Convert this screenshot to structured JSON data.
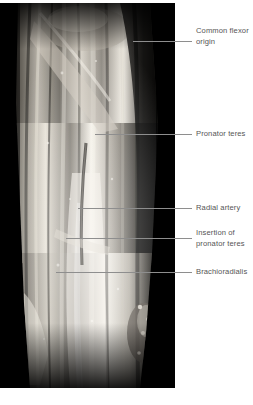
{
  "figure": {
    "kind": "anatomical-dissection-photograph",
    "region": "forearm",
    "view": "anterior",
    "photo": {
      "x": 0,
      "y": 3,
      "width": 175,
      "height": 385,
      "palette": {
        "background": "#000000",
        "tissue_light": "#f2efe9",
        "tissue_mid": "#9a958c",
        "tissue_dark": "#2a2824",
        "shadow": "#0a0a0a"
      }
    },
    "annotations": [
      {
        "id": "common-flexor-origin",
        "lines": [
          "Common flexor",
          "origin"
        ],
        "line_1": "Common flexor",
        "line_2": "origin",
        "label_x": 196,
        "label_y": 26,
        "leader": {
          "x1": 133,
          "y1": 41,
          "x2": 192,
          "y2": 41
        }
      },
      {
        "id": "pronator-teres",
        "lines": [
          "Pronator teres"
        ],
        "line_1": "Pronator teres",
        "label_x": 196,
        "label_y": 129,
        "leader": {
          "x1": 95,
          "y1": 134,
          "x2": 192,
          "y2": 134
        }
      },
      {
        "id": "radial-artery",
        "lines": [
          "Radial artery"
        ],
        "line_1": "Radial artery",
        "label_x": 196,
        "label_y": 203,
        "leader": {
          "x1": 78,
          "y1": 208,
          "x2": 192,
          "y2": 208
        }
      },
      {
        "id": "insertion-of-pronator-teres",
        "lines": [
          "Insertion of",
          "pronator teres"
        ],
        "line_1": "Insertion of",
        "line_2": "pronator teres",
        "label_x": 196,
        "label_y": 228,
        "leader": {
          "x1": 66,
          "y1": 238,
          "x2": 192,
          "y2": 238
        }
      },
      {
        "id": "brachioradialis",
        "lines": [
          "Brachioradialis"
        ],
        "line_1": "Brachioradialis",
        "label_x": 196,
        "label_y": 267,
        "leader": {
          "x1": 56,
          "y1": 272,
          "x2": 192,
          "y2": 272
        }
      }
    ]
  }
}
